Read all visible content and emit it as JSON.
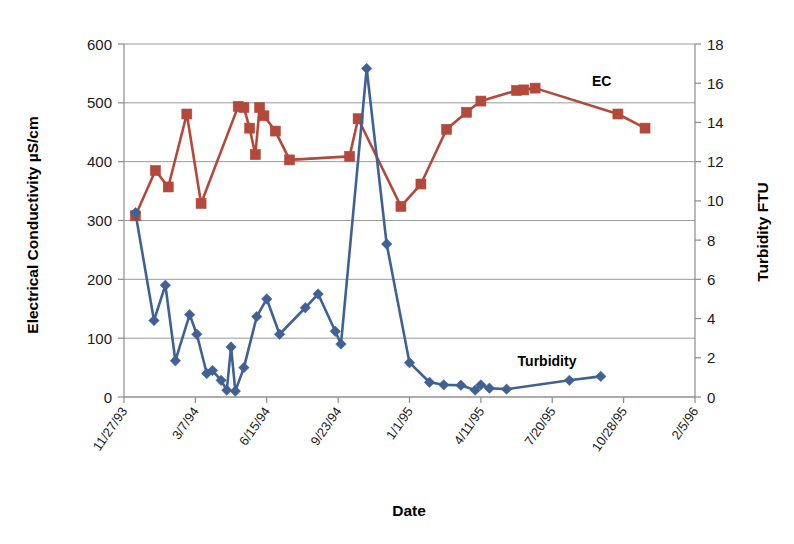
{
  "chart_data": {
    "type": "line",
    "title": "",
    "xlabel": "Date",
    "ylabel": "Electrical Conductivity µS/cm",
    "y2label": "Turbidity FTU",
    "grid": true,
    "legend_position": "inline-annotation",
    "x_tick_labels": [
      "11/27/93",
      "3/7/94",
      "6/15/94",
      "9/23/94",
      "1/1/95",
      "4/11/95",
      "7/20/95",
      "10/28/95",
      "2/5/96"
    ],
    "x_tick_days": [
      0,
      100,
      200,
      300,
      400,
      500,
      600,
      700,
      800
    ],
    "xlim": [
      0,
      800
    ],
    "y_tick_labels": [
      "0",
      "100",
      "200",
      "300",
      "400",
      "500",
      "600"
    ],
    "y_ticks": [
      0,
      100,
      200,
      300,
      400,
      500,
      600
    ],
    "ylim": [
      0,
      600
    ],
    "y2_tick_labels": [
      "0",
      "2",
      "4",
      "6",
      "8",
      "10",
      "12",
      "14",
      "16",
      "18"
    ],
    "y2_ticks": [
      0,
      2,
      4,
      6,
      8,
      10,
      12,
      14,
      16,
      18
    ],
    "y2lim": [
      0,
      18
    ],
    "series": [
      {
        "name": "EC",
        "axis": "left",
        "unit": "µS/cm",
        "color": "#b4483a",
        "marker": "square",
        "annotation": "EC",
        "points": [
          {
            "x": 16,
            "y": 308
          },
          {
            "x": 44,
            "y": 385
          },
          {
            "x": 62,
            "y": 357
          },
          {
            "x": 88,
            "y": 481
          },
          {
            "x": 108,
            "y": 329
          },
          {
            "x": 160,
            "y": 494
          },
          {
            "x": 168,
            "y": 492
          },
          {
            "x": 176,
            "y": 457
          },
          {
            "x": 184,
            "y": 412
          },
          {
            "x": 190,
            "y": 492
          },
          {
            "x": 196,
            "y": 478
          },
          {
            "x": 212,
            "y": 452
          },
          {
            "x": 232,
            "y": 403
          },
          {
            "x": 316,
            "y": 409
          },
          {
            "x": 328,
            "y": 473
          },
          {
            "x": 388,
            "y": 324
          },
          {
            "x": 416,
            "y": 362
          },
          {
            "x": 452,
            "y": 455
          },
          {
            "x": 480,
            "y": 484
          },
          {
            "x": 500,
            "y": 503
          },
          {
            "x": 550,
            "y": 521
          },
          {
            "x": 560,
            "y": 522
          },
          {
            "x": 576,
            "y": 525
          },
          {
            "x": 692,
            "y": 481
          },
          {
            "x": 730,
            "y": 457
          }
        ]
      },
      {
        "name": "Turbidity",
        "axis": "right",
        "unit": "FTU",
        "color": "#3f6193",
        "marker": "diamond",
        "annotation": "Turbidity",
        "points": [
          {
            "x": 16,
            "y": 9.4
          },
          {
            "x": 42,
            "y": 3.9
          },
          {
            "x": 58,
            "y": 5.7
          },
          {
            "x": 72,
            "y": 1.85
          },
          {
            "x": 92,
            "y": 4.2
          },
          {
            "x": 102,
            "y": 3.2
          },
          {
            "x": 116,
            "y": 1.2
          },
          {
            "x": 124,
            "y": 1.35
          },
          {
            "x": 136,
            "y": 0.85
          },
          {
            "x": 144,
            "y": 0.35
          },
          {
            "x": 150,
            "y": 2.55
          },
          {
            "x": 156,
            "y": 0.3
          },
          {
            "x": 168,
            "y": 1.5
          },
          {
            "x": 186,
            "y": 4.1
          },
          {
            "x": 200,
            "y": 5.0
          },
          {
            "x": 218,
            "y": 3.2
          },
          {
            "x": 254,
            "y": 4.55
          },
          {
            "x": 272,
            "y": 5.25
          },
          {
            "x": 296,
            "y": 3.35
          },
          {
            "x": 304,
            "y": 2.7
          },
          {
            "x": 340,
            "y": 16.75
          },
          {
            "x": 368,
            "y": 7.8
          },
          {
            "x": 400,
            "y": 1.75
          },
          {
            "x": 428,
            "y": 0.75
          },
          {
            "x": 448,
            "y": 0.62
          },
          {
            "x": 472,
            "y": 0.6
          },
          {
            "x": 492,
            "y": 0.35
          },
          {
            "x": 500,
            "y": 0.62
          },
          {
            "x": 512,
            "y": 0.45
          },
          {
            "x": 536,
            "y": 0.4
          },
          {
            "x": 624,
            "y": 0.85
          },
          {
            "x": 668,
            "y": 1.05
          }
        ]
      }
    ]
  },
  "axes": {
    "left_title": "Electrical Conductivity µS/cm",
    "right_title": "Turbidity FTU",
    "bottom_title": "Date"
  },
  "annotations": {
    "ec_label": "EC",
    "turbidity_label": "Turbidity"
  },
  "colors": {
    "ec": "#b4483a",
    "turbidity": "#3f6193",
    "grid": "#9a9a9a",
    "axis": "#8c8c8c",
    "text": "#1a1a1a"
  }
}
